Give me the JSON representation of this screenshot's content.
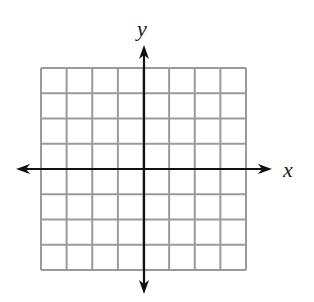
{
  "diagram": {
    "type": "coordinate-plane",
    "grid": {
      "columns": 8,
      "rows": 8,
      "left": 41,
      "top": 68,
      "right": 246,
      "bottom": 270,
      "line_color": "#9a9a9a",
      "line_width": 2
    },
    "axes": {
      "color": "#111111",
      "x_axis": {
        "label": "x",
        "y": 169,
        "from": 16,
        "to": 272
      },
      "y_axis": {
        "label": "y",
        "x": 144,
        "from": 45,
        "to": 294
      }
    },
    "labels": {
      "x": "x",
      "y": "y"
    }
  }
}
